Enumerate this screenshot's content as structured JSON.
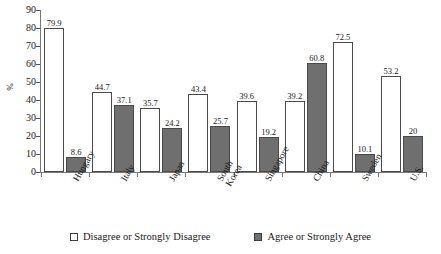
{
  "chart_data": {
    "type": "bar",
    "title": "",
    "xlabel": "",
    "ylabel": "%",
    "ylim": [
      0,
      90
    ],
    "yticks": [
      0,
      10,
      20,
      30,
      40,
      50,
      60,
      70,
      80,
      90
    ],
    "grid": false,
    "legend_position": "bottom",
    "categories": [
      "Hungary",
      "Italy",
      "Japan",
      "South Korea",
      "Singapore",
      "China",
      "Sweden",
      "U.S."
    ],
    "series": [
      {
        "name": "Disagree or Strongly Disagree",
        "color": "#ffffff",
        "values": [
          79.9,
          44.7,
          35.7,
          43.4,
          39.6,
          39.2,
          72.5,
          53.2
        ],
        "labels": [
          "79.9",
          "44.7",
          "35.7",
          "43.4",
          "39.6",
          "39.2",
          "72.5",
          "53.2"
        ]
      },
      {
        "name": "Agree or Strongly Agree",
        "color": "#6f6f6f",
        "values": [
          8.6,
          37.1,
          24.2,
          25.7,
          19.2,
          60.8,
          10.1,
          20
        ],
        "labels": [
          "8.6",
          "37.1",
          "24.2",
          "25.7",
          "19.2",
          "60.8",
          "10.1",
          "20"
        ]
      }
    ]
  },
  "axis": {
    "y_title": "%",
    "y_tick_labels": [
      "90",
      "80",
      "70",
      "60",
      "50",
      "40",
      "30",
      "20",
      "10",
      "0"
    ],
    "category_labels": [
      "Hungary",
      "Italy",
      "Japan",
      "South\nKorea",
      "Singapore",
      "China",
      "Sweden",
      "U.S."
    ]
  },
  "legend": {
    "items": [
      {
        "label": "Disagree or Strongly Disagree",
        "swatch": "open-square-swatch"
      },
      {
        "label": "Agree or Strongly Agree",
        "swatch": "filled-square-swatch"
      }
    ]
  }
}
